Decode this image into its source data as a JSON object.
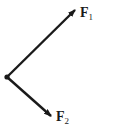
{
  "diagram": {
    "type": "force-vectors",
    "origin": {
      "x": 7,
      "y": 77
    },
    "vectors": [
      {
        "name": "F1",
        "label_main": "F",
        "label_sub": "1",
        "tip": {
          "x": 75,
          "y": 10
        },
        "label_pos": {
          "x": 80,
          "y": 6
        }
      },
      {
        "name": "F2",
        "label_main": "F",
        "label_sub": "2",
        "tip": {
          "x": 51,
          "y": 116
        },
        "label_pos": {
          "x": 56,
          "y": 110
        }
      }
    ],
    "colors": {
      "line": "#1a1a1a",
      "background": "#ffffff"
    }
  }
}
